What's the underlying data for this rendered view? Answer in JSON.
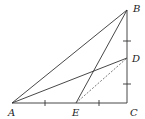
{
  "diagram": {
    "type": "geometry-figure",
    "points": {
      "A": {
        "label": "A",
        "x": 12,
        "y": 103,
        "label_x": 8,
        "label_y": 116
      },
      "B": {
        "label": "B",
        "x": 127,
        "y": 10,
        "label_x": 133,
        "label_y": 12
      },
      "C": {
        "label": "C",
        "x": 127,
        "y": 103,
        "label_x": 130,
        "label_y": 116
      },
      "D": {
        "label": "D",
        "x": 127,
        "y": 58,
        "label_x": 132,
        "label_y": 62
      },
      "E": {
        "label": "E",
        "x": 76,
        "y": 103,
        "label_x": 72,
        "label_y": 116
      }
    },
    "segments": [
      {
        "from": "A",
        "to": "B",
        "style": "solid"
      },
      {
        "from": "B",
        "to": "C",
        "style": "solid"
      },
      {
        "from": "A",
        "to": "C",
        "style": "solid"
      },
      {
        "from": "A",
        "to": "D",
        "style": "solid"
      },
      {
        "from": "B",
        "to": "E",
        "style": "solid"
      },
      {
        "from": "E",
        "to": "D",
        "style": "dashed"
      }
    ],
    "equal_marks": {
      "AC": [
        {
          "x": 45,
          "y": 103
        },
        {
          "x": 99,
          "y": 103
        }
      ],
      "BC": [
        {
          "x": 127,
          "y": 41
        },
        {
          "x": 127,
          "y": 84
        }
      ]
    },
    "colors": {
      "line": "#333333",
      "dashed": "#555555",
      "label": "#222222",
      "background": "#ffffff"
    }
  }
}
